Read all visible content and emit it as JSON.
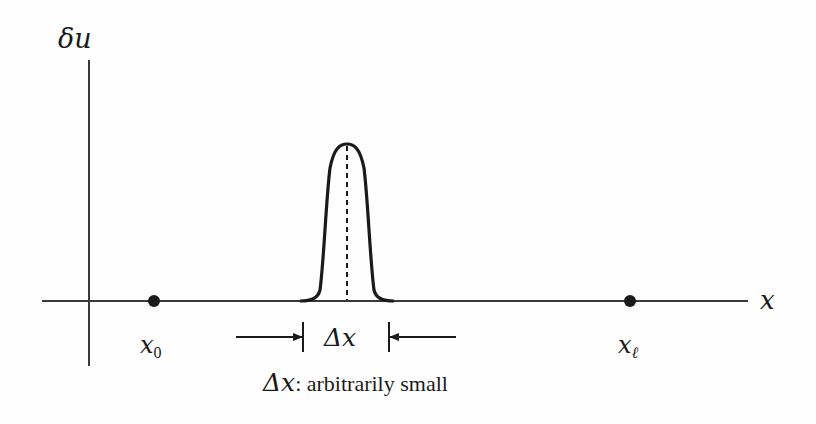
{
  "diagram": {
    "type": "perturbation-function-plot",
    "axes": {
      "y_label": "δu",
      "x_label": "x"
    },
    "points": [
      {
        "id": "x0",
        "label_base": "x",
        "label_sub": "0"
      },
      {
        "id": "xl",
        "label_base": "x",
        "label_sub": "ℓ"
      }
    ],
    "pulse": {
      "width_label": "Δx",
      "center_line": "dashed"
    },
    "caption": {
      "symbol": "Δx",
      "text": ": arbitrarily small"
    },
    "colors": {
      "ink": "#1a1a1a",
      "axis": "#3a3a3a",
      "background": "#fefefe"
    }
  }
}
